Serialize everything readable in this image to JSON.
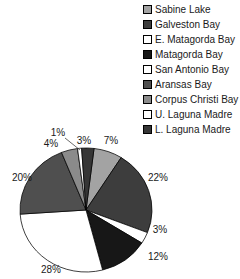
{
  "chart_data": {
    "type": "pie",
    "title": "",
    "legend_position": "top-right",
    "direction": "clockwise",
    "first_slice_start_deg": 7,
    "geometry": {
      "cx": 86,
      "cy": 210,
      "rx": 66,
      "ry": 62
    },
    "colors": {
      "background": "#ffffff",
      "slice_outline": "#000000",
      "text": "#1a1a1a"
    },
    "slices": [
      {
        "name": "Sabine Lake",
        "value_pct": 7,
        "label": "7%",
        "color": "#a3a3a3",
        "label_x": 111,
        "label_y": 144
      },
      {
        "name": "Galveston Bay",
        "value_pct": 22,
        "label": "22%",
        "color": "#3d3d3d",
        "label_x": 158,
        "label_y": 181
      },
      {
        "name": "E. Matagorda Bay",
        "value_pct": 3,
        "label": "3%",
        "color": "#ffffff",
        "label_x": 160,
        "label_y": 233
      },
      {
        "name": "Matagorda Bay",
        "value_pct": 12,
        "label": "12%",
        "color": "#171717",
        "label_x": 158,
        "label_y": 260
      },
      {
        "name": "San Antonio Bay",
        "value_pct": 28,
        "label": "28%",
        "color": "#ffffff",
        "label_x": 51,
        "label_y": 273
      },
      {
        "name": "Aransas Bay",
        "value_pct": 20,
        "label": "20%",
        "color": "#4f4f4f",
        "label_x": 22,
        "label_y": 181
      },
      {
        "name": "Corpus Christi Bay",
        "value_pct": 4,
        "label": "4%",
        "color": "#8b8b8b",
        "label_x": 51,
        "label_y": 147
      },
      {
        "name": "U. Laguna Madre",
        "value_pct": 1,
        "label": "1%",
        "color": "#ffffff",
        "label_x": 58,
        "label_y": 136,
        "leader_line": {
          "x1": 65,
          "y1": 138,
          "x2": 80,
          "y2": 150
        }
      },
      {
        "name": "L. Laguna Madre",
        "value_pct": 3,
        "label": "3%",
        "color": "#363636",
        "label_x": 84,
        "label_y": 144
      }
    ]
  }
}
